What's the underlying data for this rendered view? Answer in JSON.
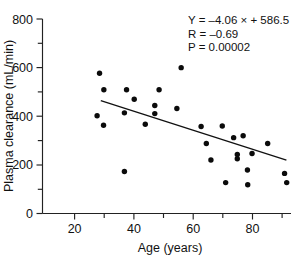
{
  "chart_data": {
    "type": "scatter",
    "title": "",
    "subtitle": "",
    "xlabel": "Age (years)",
    "ylabel": "Plasma clearance (mL/min)",
    "xlim": [
      11,
      92
    ],
    "ylim": [
      0,
      800
    ],
    "grid": false,
    "legend": null,
    "x_ticks_major": [
      20,
      40,
      60,
      80
    ],
    "x_tick_labels": [
      "20",
      "40",
      "60",
      "80"
    ],
    "x_ticks_minor": [
      30,
      50,
      70,
      90
    ],
    "y_ticks_major": [
      0,
      200,
      400,
      600,
      800
    ],
    "y_tick_labels": [
      "0",
      "200",
      "400",
      "600",
      "800"
    ],
    "y_ticks_minor": [
      100,
      300,
      500,
      700
    ],
    "marker": "filled-circle",
    "marker_color": "#0b0b0b",
    "points": [
      {
        "x": 28.8,
        "y": 402
      },
      {
        "x": 29.6,
        "y": 577
      },
      {
        "x": 31.0,
        "y": 509
      },
      {
        "x": 30.9,
        "y": 363
      },
      {
        "x": 37.7,
        "y": 414
      },
      {
        "x": 37.7,
        "y": 173
      },
      {
        "x": 38.4,
        "y": 509
      },
      {
        "x": 40.9,
        "y": 470
      },
      {
        "x": 44.5,
        "y": 367
      },
      {
        "x": 47.6,
        "y": 444
      },
      {
        "x": 47.6,
        "y": 411
      },
      {
        "x": 49.0,
        "y": 509
      },
      {
        "x": 54.8,
        "y": 432
      },
      {
        "x": 56.2,
        "y": 600
      },
      {
        "x": 62.7,
        "y": 358
      },
      {
        "x": 64.4,
        "y": 288
      },
      {
        "x": 65.9,
        "y": 220
      },
      {
        "x": 69.6,
        "y": 360
      },
      {
        "x": 70.7,
        "y": 127
      },
      {
        "x": 73.3,
        "y": 312
      },
      {
        "x": 74.5,
        "y": 243
      },
      {
        "x": 74.5,
        "y": 225
      },
      {
        "x": 76.4,
        "y": 320
      },
      {
        "x": 77.8,
        "y": 179
      },
      {
        "x": 77.9,
        "y": 118
      },
      {
        "x": 79.3,
        "y": 247
      },
      {
        "x": 84.4,
        "y": 288
      },
      {
        "x": 89.9,
        "y": 165
      },
      {
        "x": 90.6,
        "y": 127
      }
    ],
    "fit_line": {
      "slope": -4.06,
      "intercept": 586.5,
      "x_start": 30.0,
      "x_end": 90.5,
      "y_start": 464.7,
      "y_end": 219.1
    },
    "annotations": {
      "equation": "Y = –4.06 × + 586.5",
      "correlation": "R = –0.69",
      "pvalue": "P = 0.00002"
    }
  }
}
